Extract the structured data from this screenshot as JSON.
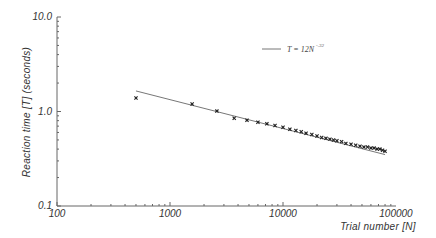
{
  "chart_data": {
    "type": "scatter",
    "title": "",
    "xlabel": "Trial number [N]",
    "ylabel": "Reaction time [T] (seconds)",
    "xscale": "log",
    "yscale": "log",
    "xlim": [
      100,
      100000
    ],
    "ylim": [
      0.1,
      10.0
    ],
    "x_ticks": [
      "100",
      "1000",
      "10000",
      "100000"
    ],
    "y_ticks": [
      "0.1",
      "1.0",
      "10.0"
    ],
    "grid": false,
    "legend_position": "upper right",
    "series": [
      {
        "name": "observed",
        "marker": "x",
        "x": [
          500,
          1570,
          2600,
          3700,
          4800,
          6000,
          7200,
          8500,
          10000,
          11500,
          13000,
          14500,
          16000,
          18000,
          20000,
          22000,
          24000,
          26000,
          28000,
          30000,
          33000,
          36000,
          40000,
          44000,
          48000,
          52000,
          56000,
          60000,
          64000,
          68000,
          72000,
          76000,
          80000
        ],
        "values": [
          1.39,
          1.2,
          1.01,
          0.85,
          0.81,
          0.77,
          0.74,
          0.71,
          0.68,
          0.65,
          0.63,
          0.61,
          0.59,
          0.57,
          0.55,
          0.53,
          0.52,
          0.51,
          0.5,
          0.49,
          0.48,
          0.46,
          0.45,
          0.44,
          0.43,
          0.42,
          0.42,
          0.41,
          0.41,
          0.4,
          0.4,
          0.39,
          0.38
        ]
      },
      {
        "name": "T = 12N^-.32",
        "type": "line",
        "x": [
          500,
          80000
        ],
        "values": [
          1.65,
          0.35
        ]
      }
    ],
    "legend": {
      "label_main": "T = 12N",
      "label_exponent": "-.32"
    }
  }
}
